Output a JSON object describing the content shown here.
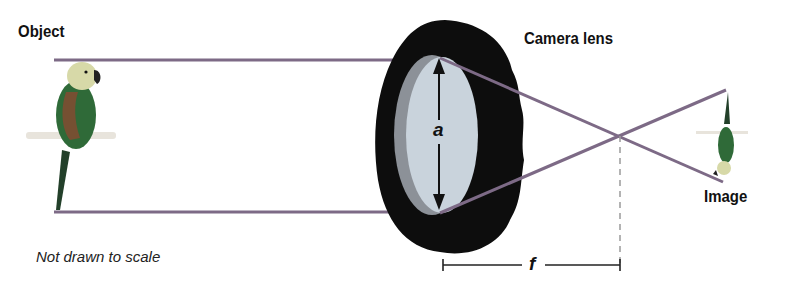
{
  "labels": {
    "object": "Object",
    "camera_lens": "Camera lens",
    "image": "Image",
    "note": "Not drawn to scale",
    "aperture_var": "a",
    "focal_var": "f"
  },
  "colors": {
    "ray": "#7d6a86",
    "lens_body": "#0d0d0d",
    "lens_glass": "#c9d3dc",
    "lens_edge": "#8c9198",
    "dimension": "#222222",
    "dashed": "#9a9a9a",
    "parrot_body": "#2f6a38",
    "parrot_head": "#d7d9a8",
    "parrot_tail": "#23402a",
    "perch": "#e8e4dc"
  }
}
